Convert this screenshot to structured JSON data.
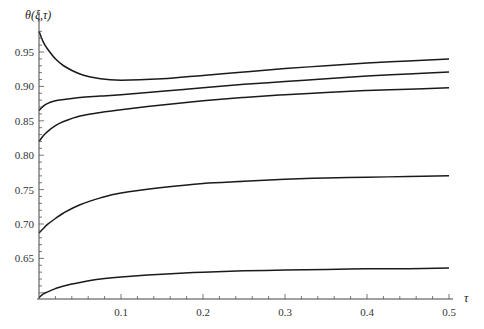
{
  "chart_data": {
    "type": "line",
    "title": "",
    "xlabel": "τ",
    "ylabel": "θ(ξ,τ)",
    "xlim": [
      0,
      0.5
    ],
    "ylim": [
      0.59,
      0.99
    ],
    "x_ticks": [
      "0.1",
      "0.2",
      "0.3",
      "0.4",
      "0.5"
    ],
    "x_tick_values": [
      0.1,
      0.2,
      0.3,
      0.4,
      0.5
    ],
    "y_ticks": [
      "0.65",
      "0.70",
      "0.75",
      "0.80",
      "0.85",
      "0.90",
      "0.95"
    ],
    "y_tick_values": [
      0.65,
      0.7,
      0.75,
      0.8,
      0.85,
      0.9,
      0.95
    ],
    "grid": false,
    "legend": "none",
    "x": [
      0.0,
      0.005,
      0.01,
      0.02,
      0.03,
      0.05,
      0.075,
      0.1,
      0.15,
      0.2,
      0.25,
      0.3,
      0.35,
      0.4,
      0.45,
      0.5
    ],
    "series": [
      {
        "name": "curve-1",
        "values": [
          0.98,
          0.965,
          0.955,
          0.94,
          0.93,
          0.918,
          0.911,
          0.909,
          0.911,
          0.916,
          0.921,
          0.926,
          0.93,
          0.934,
          0.937,
          0.94
        ]
      },
      {
        "name": "curve-2",
        "values": [
          0.865,
          0.871,
          0.875,
          0.879,
          0.881,
          0.884,
          0.886,
          0.888,
          0.893,
          0.898,
          0.903,
          0.907,
          0.911,
          0.915,
          0.918,
          0.921
        ]
      },
      {
        "name": "curve-3",
        "values": [
          0.82,
          0.828,
          0.834,
          0.843,
          0.849,
          0.857,
          0.862,
          0.866,
          0.873,
          0.879,
          0.884,
          0.888,
          0.891,
          0.894,
          0.896,
          0.898
        ]
      },
      {
        "name": "curve-4",
        "values": [
          0.687,
          0.693,
          0.699,
          0.708,
          0.716,
          0.728,
          0.738,
          0.745,
          0.753,
          0.759,
          0.762,
          0.765,
          0.767,
          0.768,
          0.769,
          0.77
        ]
      },
      {
        "name": "curve-5",
        "values": [
          0.593,
          0.598,
          0.601,
          0.606,
          0.61,
          0.615,
          0.62,
          0.623,
          0.627,
          0.63,
          0.632,
          0.633,
          0.634,
          0.635,
          0.635,
          0.636
        ]
      }
    ]
  }
}
